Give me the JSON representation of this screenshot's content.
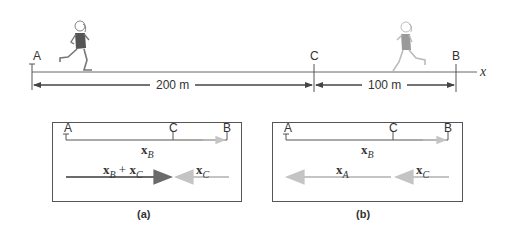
{
  "scene": {
    "points": [
      {
        "id": "A",
        "label": "A"
      },
      {
        "id": "C",
        "label": "C"
      },
      {
        "id": "B",
        "label": "B"
      }
    ],
    "axis_label": "x",
    "distances": [
      {
        "from": "A",
        "to": "C",
        "label": "200 m"
      },
      {
        "from": "C",
        "to": "B",
        "label": "100 m"
      }
    ],
    "runners": [
      {
        "position": "near A",
        "shade": "dark"
      },
      {
        "position": "between C and B",
        "shade": "light"
      }
    ]
  },
  "panel_a": {
    "caption": "(a)",
    "points": [
      "A",
      "C",
      "B"
    ],
    "top_vector": {
      "base": "x",
      "sub": "B"
    },
    "bottom_left": {
      "base1": "x",
      "sub1": "B",
      "op": " + ",
      "base2": "x",
      "sub2": "C"
    },
    "bottom_right": {
      "base": "x",
      "sub": "C"
    }
  },
  "panel_b": {
    "caption": "(b)",
    "points": [
      "A",
      "C",
      "B"
    ],
    "top_vector": {
      "base": "x",
      "sub": "B"
    },
    "bottom_left": {
      "base": "x",
      "sub": "A"
    },
    "bottom_right": {
      "base": "x",
      "sub": "C"
    }
  },
  "colors": {
    "line": "#555555",
    "dark_vector": "#6b6b6b",
    "light_vector": "#c4c4c4",
    "runner_dark": "#555555",
    "runner_light": "#9a9a9a"
  }
}
